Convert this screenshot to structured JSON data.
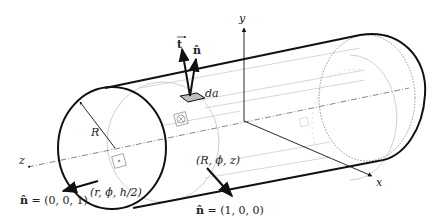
{
  "figure": {
    "labels": {
      "y_axis": "y",
      "x_axis": "x",
      "z_axis": "z",
      "radius": "R",
      "area_element": "da",
      "traction_vector": "t",
      "normal_vector": "n̂",
      "lateral_point": "(R, ϕ, z)",
      "end_point": "(r, ϕ, h/2)",
      "end_normal_symbol": "n̂",
      "end_normal_value": " = (0, 0, 1)",
      "lateral_normal_symbol": "n̂",
      "lateral_normal_value": " = (1, 0, 0)"
    },
    "colors": {
      "ink": "#111111",
      "faint": "#b8b8b8",
      "patch": "#bdbdbd"
    }
  }
}
